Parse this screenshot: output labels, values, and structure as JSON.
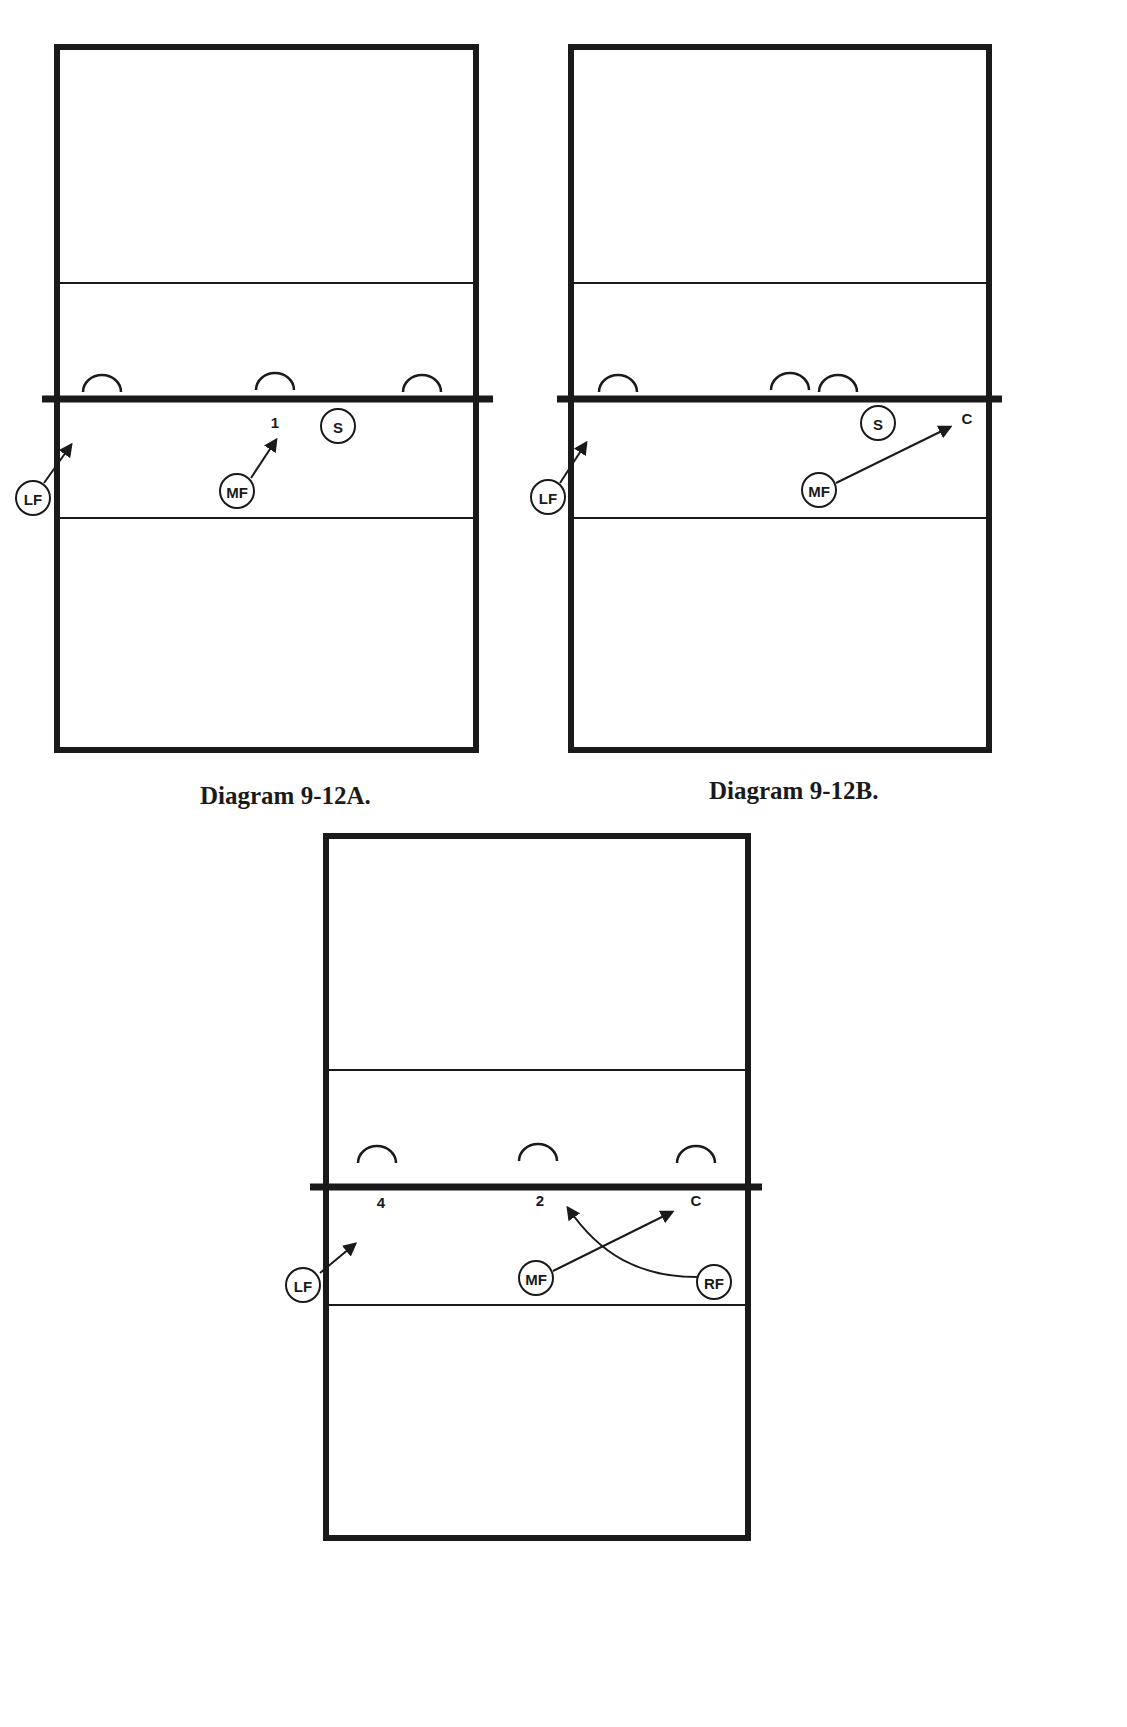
{
  "colors": {
    "ink": "#1a1a1a",
    "paper": "#ffffff"
  },
  "diagrams": [
    {
      "id": "9-12A",
      "caption": "Diagram 9-12A.",
      "court": {
        "x": 57,
        "y": 47,
        "w": 419,
        "h": 703
      },
      "lines": {
        "top_attack": 283,
        "net": 399,
        "net_x1": 42,
        "net_x2": 493,
        "bottom_attack": 518
      },
      "blockers": [
        {
          "cx": 102,
          "cy": 390
        },
        {
          "cx": 275,
          "cy": 388
        },
        {
          "cx": 422,
          "cy": 390
        }
      ],
      "players": [
        {
          "label": "LF",
          "cx": 33,
          "cy": 498
        },
        {
          "label": "MF",
          "cx": 237,
          "cy": 491
        },
        {
          "label": "S",
          "cx": 338,
          "cy": 426
        }
      ],
      "spots": [
        {
          "label": "1",
          "x": 275,
          "y": 428
        }
      ],
      "paths": [
        {
          "from": "LF",
          "d": "M 44 483 L 71 445"
        },
        {
          "from": "MF",
          "d": "M 251 478 L 276 440"
        }
      ]
    },
    {
      "id": "9-12B",
      "caption": "Diagram 9-12B.",
      "court": {
        "x": 571,
        "y": 47,
        "w": 418,
        "h": 703
      },
      "lines": {
        "top_attack": 283,
        "net": 399,
        "net_x1": 557,
        "net_x2": 1002,
        "bottom_attack": 518
      },
      "blockers": [
        {
          "cx": 618,
          "cy": 390
        },
        {
          "cx": 790,
          "cy": 388
        },
        {
          "cx": 838,
          "cy": 390
        }
      ],
      "players": [
        {
          "label": "LF",
          "cx": 548,
          "cy": 497
        },
        {
          "label": "MF",
          "cx": 819,
          "cy": 490
        },
        {
          "label": "S",
          "cx": 878,
          "cy": 423
        }
      ],
      "spots": [
        {
          "label": "C",
          "x": 967,
          "y": 424
        }
      ],
      "paths": [
        {
          "from": "LF",
          "d": "M 560 483 L 586 443"
        },
        {
          "from": "MF",
          "d": "M 836 483 L 950 427"
        }
      ]
    },
    {
      "id": "9-12C",
      "caption": "",
      "court": {
        "x": 326,
        "y": 836,
        "w": 422,
        "h": 702
      },
      "lines": {
        "top_attack": 1070,
        "net": 1187,
        "net_x1": 310,
        "net_x2": 762,
        "bottom_attack": 1305
      },
      "blockers": [
        {
          "cx": 377,
          "cy": 1161
        },
        {
          "cx": 538,
          "cy": 1159
        },
        {
          "cx": 696,
          "cy": 1161
        }
      ],
      "players": [
        {
          "label": "LF",
          "cx": 303,
          "cy": 1285
        },
        {
          "label": "MF",
          "cx": 536,
          "cy": 1278
        },
        {
          "label": "RF",
          "cx": 714,
          "cy": 1282
        }
      ],
      "spots": [
        {
          "label": "4",
          "x": 381,
          "y": 1208
        },
        {
          "label": "2",
          "x": 540,
          "y": 1206
        },
        {
          "label": "C",
          "x": 696,
          "y": 1206
        }
      ],
      "paths": [
        {
          "from": "LF",
          "d": "M 320 1273 L 355 1244"
        },
        {
          "from": "MF",
          "d": "M 553 1271 L 672 1212"
        },
        {
          "from": "RF",
          "d": "M 697 1277 C 640 1277 600 1255 568 1208"
        }
      ]
    }
  ],
  "captions": {
    "a": {
      "text": "Diagram 9-12A.",
      "x": 200,
      "y": 782
    },
    "b": {
      "text": "Diagram 9-12B.",
      "x": 709,
      "y": 777
    }
  }
}
